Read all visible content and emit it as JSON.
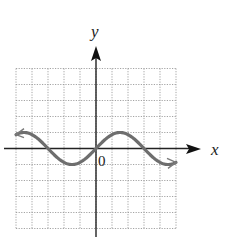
{
  "chart_data": {
    "type": "line",
    "title": "",
    "xlabel": "x",
    "ylabel": "y",
    "origin_label": "0",
    "xlim": [
      -5,
      5
    ],
    "ylim": [
      -5,
      5
    ],
    "grid": true,
    "grid_step": 1,
    "function_description": "sinusoid through origin, amplitude 1, period 6 (y = sin(pi*x/3))",
    "series": [
      {
        "name": "curve",
        "x": [
          -5,
          -4.5,
          -4,
          -3.5,
          -3,
          -2.5,
          -2,
          -1.5,
          -1,
          -0.5,
          0,
          0.5,
          1,
          1.5,
          2,
          2.5,
          3,
          3.5,
          4,
          4.5,
          5
        ],
        "y": [
          0.87,
          1.0,
          0.87,
          0.5,
          0.0,
          -0.5,
          -0.87,
          -1.0,
          -0.87,
          -0.5,
          0.0,
          0.5,
          0.87,
          1.0,
          0.87,
          0.5,
          0.0,
          -0.5,
          -0.87,
          -1.0,
          -0.87
        ],
        "arrows_both_ends": true,
        "color": "#6b6b6b"
      }
    ]
  },
  "labels": {
    "x_axis": "x",
    "y_axis": "y",
    "origin": "0"
  }
}
